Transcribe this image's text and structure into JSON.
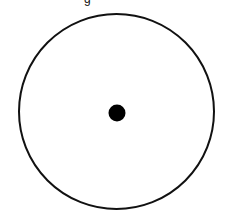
{
  "diagram": {
    "type": "circle-with-center-point",
    "background_color": "#ffffff",
    "stroke_color": "#111111",
    "circle": {
      "cx": 116.5,
      "cy": 111.5,
      "r": 97.5,
      "stroke_width": 2
    },
    "center_point": {
      "cx": 117,
      "cy": 113,
      "r": 8.5,
      "fill": "#000000"
    },
    "top_caption_fragment": "g"
  }
}
